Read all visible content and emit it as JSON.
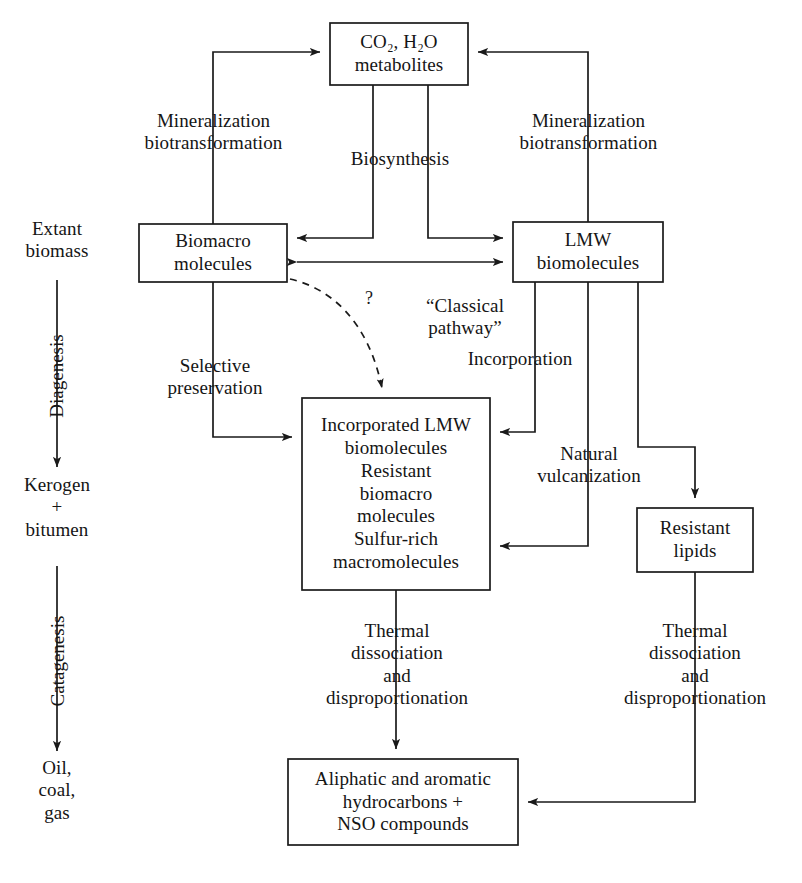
{
  "diagram": {
    "stroke_color": "#1a1a1a",
    "background": "#ffffff"
  },
  "timeline": {
    "stage_start": "Extant\nbiomass",
    "stage_middle": "Kerogen\n+\nbitumen",
    "stage_end": "Oil,\ncoal,\ngas",
    "arrow_label_1": "Diagenesis",
    "arrow_label_2": "Catagenesis"
  },
  "boxes": {
    "co2": "CO₂, H₂O\nmetabolites",
    "biomacro": "Biomacro\nmolecules",
    "lmw": "LMW\nbiomolecules",
    "incorporated": "Incorporated LMW\nbiomolecules\nResistant\nbiomacro\nmolecules\nSulfur-rich\nmacromolecules",
    "resistant_lipids": "Resistant\nlipids",
    "hydrocarbons": "Aliphatic and aromatic\nhydrocarbons +\nNSO compounds"
  },
  "process_labels": {
    "mineralization_left": "Mineralization\nbiotransformation",
    "mineralization_right": "Mineralization\nbiotransformation",
    "biosynthesis": "Biosynthesis",
    "selective_preservation": "Selective\npreservation",
    "classical_pathway": "“Classical\npathway”",
    "incorporation": "Incorporation",
    "natural_vulcanization": "Natural\nvulcanization",
    "thermal_left": "Thermal\ndissociation\nand\ndisproportionation",
    "thermal_right": "Thermal\ndissociation\nand\ndisproportionation",
    "uncertainty_marker": "?"
  }
}
